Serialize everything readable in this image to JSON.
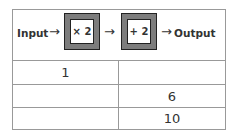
{
  "machine": {
    "input_label": "Input",
    "output_label": "Output",
    "arrow": "→",
    "operations": [
      {
        "label": "× 2"
      },
      {
        "label": "+ 2"
      }
    ]
  },
  "table": {
    "rows": [
      {
        "input": "1",
        "output": ""
      },
      {
        "input": "",
        "output": "6"
      },
      {
        "input": "",
        "output": "10"
      }
    ]
  }
}
